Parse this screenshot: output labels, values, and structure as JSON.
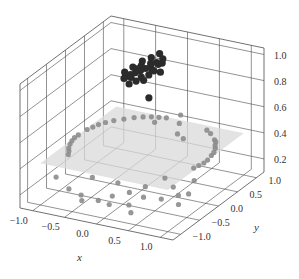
{
  "chart_data": {
    "type": "scatter3d",
    "title": "",
    "xlabel": "x",
    "ylabel": "y",
    "zlabel": "",
    "xlim": [
      -1.2,
      1.2
    ],
    "ylim": [
      -1.2,
      1.2
    ],
    "zlim": [
      0.1,
      1.05
    ],
    "xticks": [
      -1.0,
      -0.5,
      0.0,
      0.5,
      1.0
    ],
    "yticks": [
      -1.0,
      -0.5,
      0.0,
      0.5,
      1.0
    ],
    "zticks": [
      0.2,
      0.4,
      0.6,
      0.8,
      1.0
    ],
    "xtick_labels": [
      "−1.0",
      "−0.5",
      "0.0",
      "0.5",
      "1.0"
    ],
    "ytick_labels": [
      "−1.0",
      "−0.5",
      "0.0",
      "0.5",
      "1.0"
    ],
    "ztick_labels": [
      "0.2",
      "0.4",
      "0.6",
      "0.8",
      "1.0"
    ],
    "grid": true,
    "legend": null,
    "colors": {
      "cluster": "#2b2b2b",
      "ring": "#8c8c8c",
      "plane": "#d9d9d9",
      "grid": "#4a4a4a"
    },
    "plane": {
      "description": "translucent horizontal decision plane",
      "z": 0.42,
      "x_range": [
        -1.0,
        1.0
      ],
      "y_range": [
        -1.0,
        1.0
      ]
    },
    "series": [
      {
        "name": "inner cluster (high z)",
        "color": "#2b2b2b",
        "points": [
          [
            -0.35,
            0.55,
            0.86
          ],
          [
            -0.3,
            0.6,
            0.87
          ],
          [
            -0.25,
            0.65,
            0.88
          ],
          [
            -0.2,
            0.6,
            0.87
          ],
          [
            -0.4,
            0.5,
            0.85
          ],
          [
            -0.45,
            0.45,
            0.84
          ],
          [
            -0.5,
            0.4,
            0.83
          ],
          [
            -0.38,
            0.62,
            0.88
          ],
          [
            -0.28,
            0.7,
            0.89
          ],
          [
            -0.2,
            0.72,
            0.9
          ],
          [
            -0.15,
            0.68,
            0.9
          ],
          [
            -0.1,
            0.7,
            0.91
          ],
          [
            -0.32,
            0.52,
            0.82
          ],
          [
            -0.42,
            0.58,
            0.86
          ],
          [
            -0.22,
            0.55,
            0.84
          ],
          [
            -0.48,
            0.52,
            0.8
          ],
          [
            -0.55,
            0.45,
            0.8
          ],
          [
            -0.36,
            0.45,
            0.8
          ],
          [
            -0.26,
            0.48,
            0.81
          ],
          [
            -0.18,
            0.62,
            0.86
          ],
          [
            -0.12,
            0.75,
            0.93
          ],
          [
            -0.3,
            0.75,
            0.92
          ],
          [
            -0.4,
            0.68,
            0.9
          ],
          [
            -0.5,
            0.6,
            0.86
          ],
          [
            -0.58,
            0.52,
            0.83
          ],
          [
            -0.2,
            0.8,
            0.95
          ],
          [
            -0.08,
            0.62,
            0.86
          ],
          [
            -0.44,
            0.4,
            0.78
          ],
          [
            -0.1,
            0.35,
            0.72
          ]
        ]
      },
      {
        "name": "outer ring (low z)",
        "color": "#8c8c8c",
        "points": [
          [
            -1.0,
            0.0,
            0.42
          ],
          [
            -0.98,
            0.2,
            0.42
          ],
          [
            -0.95,
            0.3,
            0.42
          ],
          [
            -0.92,
            0.4,
            0.42
          ],
          [
            -0.87,
            0.5,
            0.42
          ],
          [
            -0.8,
            0.6,
            0.42
          ],
          [
            -0.7,
            0.7,
            0.42
          ],
          [
            -0.6,
            0.8,
            0.42
          ],
          [
            -0.5,
            0.87,
            0.42
          ],
          [
            -0.4,
            0.92,
            0.42
          ],
          [
            -1.0,
            -0.1,
            0.42
          ],
          [
            -0.98,
            -0.2,
            0.42
          ],
          [
            -0.95,
            -0.3,
            0.42
          ],
          [
            -0.9,
            -0.42,
            0.42
          ],
          [
            -0.85,
            -0.5,
            0.42
          ],
          [
            -0.8,
            -0.6,
            0.42
          ],
          [
            -0.3,
            0.95,
            0.42
          ],
          [
            -0.2,
            0.98,
            0.42
          ],
          [
            0.75,
            0.65,
            0.42
          ],
          [
            0.8,
            0.6,
            0.42
          ],
          [
            0.85,
            0.5,
            0.42
          ],
          [
            0.9,
            0.42,
            0.42
          ],
          [
            0.95,
            0.3,
            0.42
          ],
          [
            0.97,
            0.2,
            0.42
          ],
          [
            1.0,
            0.05,
            0.42
          ],
          [
            1.0,
            -0.05,
            0.42
          ],
          [
            0.98,
            -0.15,
            0.42
          ],
          [
            0.96,
            -0.25,
            0.42
          ],
          [
            0.6,
            0.8,
            0.42
          ],
          [
            0.5,
            0.87,
            0.42
          ],
          [
            0.2,
            0.6,
            0.42
          ],
          [
            0.35,
            0.5,
            0.42
          ],
          [
            -0.1,
            0.5,
            0.5
          ],
          [
            0.1,
            0.85,
            0.5
          ],
          [
            0.05,
            0.9,
            0.42
          ]
        ]
      },
      {
        "name": "scattered outer points (floor)",
        "color": "#8c8c8c",
        "points": [
          [
            -1.05,
            -0.5,
            0.2
          ],
          [
            -0.7,
            -0.75,
            0.2
          ],
          [
            -0.45,
            -0.85,
            0.2
          ],
          [
            -0.35,
            -1.0,
            0.2
          ],
          [
            -0.15,
            -0.9,
            0.2
          ],
          [
            0.05,
            -0.95,
            0.2
          ],
          [
            0.3,
            -0.85,
            0.2
          ],
          [
            0.45,
            -1.05,
            0.2
          ],
          [
            -0.6,
            -0.3,
            0.2
          ],
          [
            0.1,
            -0.5,
            0.2
          ],
          [
            0.35,
            -0.55,
            0.2
          ],
          [
            0.6,
            -0.5,
            0.2
          ],
          [
            0.75,
            -0.3,
            0.2
          ],
          [
            0.55,
            -0.1,
            0.2
          ],
          [
            0.9,
            -0.55,
            0.2
          ],
          [
            0.85,
            -0.2,
            0.2
          ],
          [
            0.2,
            -0.25,
            0.2
          ],
          [
            -0.2,
            -0.3,
            0.2
          ],
          [
            0.3,
            0.1,
            0.2
          ],
          [
            -0.05,
            -0.7,
            0.2
          ],
          [
            0.7,
            0.2,
            0.2
          ]
        ]
      }
    ]
  }
}
